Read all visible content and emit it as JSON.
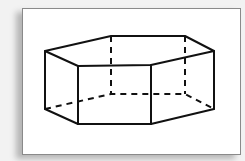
{
  "figure": {
    "stroke_color": "#111111",
    "background_color": "#ffffff",
    "frame_color": "#8a8a8a",
    "top_vertices": [
      [
        45,
        51
      ],
      [
        111,
        36
      ],
      [
        185,
        36
      ],
      [
        214,
        51
      ],
      [
        151,
        65
      ],
      [
        78,
        66
      ]
    ],
    "bottom_vertices": [
      [
        45,
        109
      ],
      [
        111,
        94
      ],
      [
        185,
        94
      ],
      [
        214,
        109
      ],
      [
        151,
        124
      ],
      [
        78,
        124
      ]
    ],
    "hidden_edges": [
      "back-left-vertical",
      "back-right-vertical",
      "bottom-back-left",
      "bottom-back",
      "bottom-back-right"
    ]
  }
}
